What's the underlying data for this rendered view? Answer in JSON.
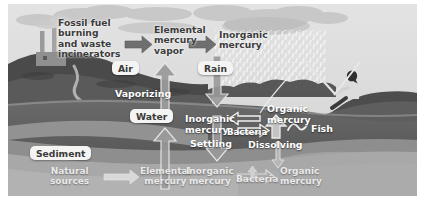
{
  "diagram": {
    "type": "environmental cycle diagram",
    "palette": {
      "sky": "#dcdcdc",
      "cloud": "#cfcfcf",
      "land_dark": "#4b4b4b",
      "hill_mid": "#6d6d6d",
      "water_dark": "#5a5a5a",
      "water_mid": "#8e8e8e",
      "sediment_light": "#b4b4b4",
      "sediment_mid": "#a0a0a0",
      "arrow_dark": "#7a7a7a",
      "arrow_white": "#f2f2f2",
      "text_dark": "#3b3b3b",
      "text_white": "#ffffff"
    },
    "zones": [
      {
        "name": "Air",
        "label": "Air"
      },
      {
        "name": "Rain",
        "label": "Rain"
      },
      {
        "name": "Water",
        "label": "Water"
      },
      {
        "name": "Sediment",
        "label": "Sediment"
      }
    ],
    "nodes": [
      {
        "id": "fossil",
        "label": "Fossil fuel burning and waste incinerators",
        "lines": [
          "Fossil fuel",
          "burning",
          "and waste",
          "incinerators"
        ],
        "region": "air"
      },
      {
        "id": "elemental_vapor",
        "label": "Elemental mercury vapor",
        "lines": [
          "Elemental",
          "mercury",
          "vapor"
        ],
        "region": "air"
      },
      {
        "id": "inorganic_air",
        "label": "Inorganic mercury",
        "lines": [
          "Inorganic",
          "mercury"
        ],
        "region": "air"
      },
      {
        "id": "inorganic_water",
        "label": "Inorganic mercury",
        "lines": [
          "Inorganic",
          "mercury"
        ],
        "region": "water"
      },
      {
        "id": "organic_water",
        "label": "Organic mercury",
        "lines": [
          "Organic",
          "mercury"
        ],
        "region": "water"
      },
      {
        "id": "bacteria_water",
        "label": "Bacteria",
        "lines": [
          "Bacteria"
        ],
        "region": "water"
      },
      {
        "id": "fish",
        "label": "Fish",
        "lines": [
          "Fish"
        ],
        "region": "water"
      },
      {
        "id": "natural_sources",
        "label": "Natural sources",
        "lines": [
          "Natural",
          "sources"
        ],
        "region": "sediment"
      },
      {
        "id": "elemental_sediment",
        "label": "Elemental mercury",
        "lines": [
          "Elemental",
          "mercury"
        ],
        "region": "sediment"
      },
      {
        "id": "inorganic_sediment",
        "label": "Inorganic mercury",
        "lines": [
          "Inorganic",
          "mercury"
        ],
        "region": "sediment"
      },
      {
        "id": "bacteria_sediment",
        "label": "Bacteria",
        "lines": [
          "Bacteria"
        ],
        "region": "sediment"
      },
      {
        "id": "organic_sediment",
        "label": "Organic mercury",
        "lines": [
          "Organic",
          "mercury"
        ],
        "region": "sediment"
      }
    ],
    "processes": [
      {
        "id": "vaporizing",
        "label": "Vaporizing"
      },
      {
        "id": "settling",
        "label": "Settling"
      },
      {
        "id": "dissolving",
        "label": "Dissolving"
      }
    ],
    "scene_objects": [
      {
        "id": "smokestacks",
        "label": "factory-smokestacks"
      },
      {
        "id": "clouds",
        "label": "clouds"
      },
      {
        "id": "rain-stipple",
        "label": "rainfall"
      },
      {
        "id": "angler",
        "label": "person-fishing"
      },
      {
        "id": "fishing-rod",
        "label": "fishing-rod"
      }
    ]
  }
}
